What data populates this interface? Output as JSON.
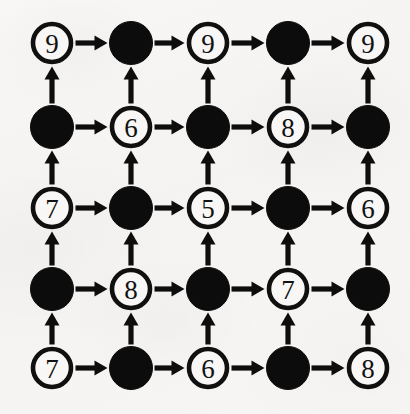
{
  "figure": {
    "type": "diagram",
    "background_color": "#f6f5f3",
    "ink_color": "#0d0d0d",
    "node_open_fill": "#f8f7f5",
    "node_filled_fill": "#0c0c0c",
    "grid": {
      "rows": 5,
      "columns": 5
    },
    "geometry": {
      "column_centers_px": [
        52,
        131,
        208,
        288,
        368
      ],
      "row_centers_px": [
        43,
        127,
        208,
        289,
        368
      ],
      "node_radius_px": 21
    },
    "edges": {
      "horizontal_direction": "left-to-right",
      "vertical_direction": "bottom-to-top",
      "arrowhead": "solid-triangle"
    }
  },
  "chart_data": {
    "type": "diagram",
    "rows": [
      [
        {
          "filled": false,
          "label": "9"
        },
        {
          "filled": true,
          "label": ""
        },
        {
          "filled": false,
          "label": "9"
        },
        {
          "filled": true,
          "label": ""
        },
        {
          "filled": false,
          "label": "9"
        }
      ],
      [
        {
          "filled": true,
          "label": ""
        },
        {
          "filled": false,
          "label": "6"
        },
        {
          "filled": true,
          "label": ""
        },
        {
          "filled": false,
          "label": "8"
        },
        {
          "filled": true,
          "label": ""
        }
      ],
      [
        {
          "filled": false,
          "label": "7"
        },
        {
          "filled": true,
          "label": ""
        },
        {
          "filled": false,
          "label": "5"
        },
        {
          "filled": true,
          "label": ""
        },
        {
          "filled": false,
          "label": "6"
        }
      ],
      [
        {
          "filled": true,
          "label": ""
        },
        {
          "filled": false,
          "label": "8"
        },
        {
          "filled": true,
          "label": ""
        },
        {
          "filled": false,
          "label": "7"
        },
        {
          "filled": true,
          "label": ""
        }
      ],
      [
        {
          "filled": false,
          "label": "7"
        },
        {
          "filled": true,
          "label": ""
        },
        {
          "filled": false,
          "label": "6"
        },
        {
          "filled": true,
          "label": ""
        },
        {
          "filled": false,
          "label": "8"
        }
      ]
    ],
    "visible_labels": [
      "9",
      "9",
      "9",
      "6",
      "8",
      "7",
      "5",
      "6",
      "8",
      "7",
      "7",
      "6",
      "8"
    ],
    "label_values": [
      9,
      9,
      9,
      6,
      8,
      7,
      5,
      6,
      8,
      7,
      7,
      6,
      8
    ],
    "legend": []
  }
}
